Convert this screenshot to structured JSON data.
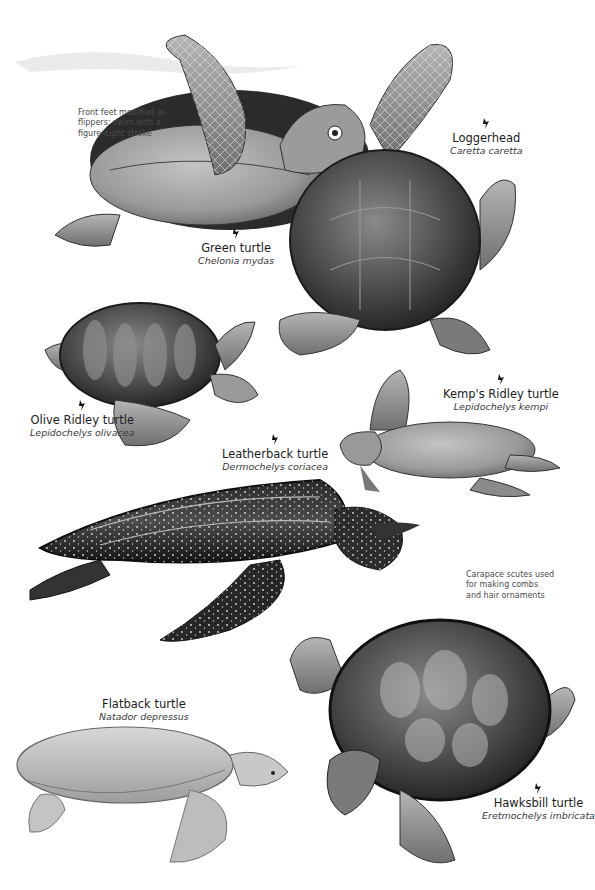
{
  "page": {
    "background": "#ffffff",
    "ink": "#1c1c1c"
  },
  "notes": {
    "green_turtle": "Front feet modified as\nflippers; swim with a\nfigure-eight stroke",
    "hawksbill": "Carapace scutes used\nfor making combs\nand hair ornaments"
  },
  "turtles": [
    {
      "id": "loggerhead",
      "common": "Loggerhead",
      "scientific": "Caretta caretta",
      "icon": "pointer-icon"
    },
    {
      "id": "green",
      "common": "Green turtle",
      "scientific": "Chelonia mydas",
      "icon": "pointer-icon"
    },
    {
      "id": "olive-ridley",
      "common": "Olive Ridley turtle",
      "scientific": "Lepidochelys olivacea",
      "icon": "pointer-icon"
    },
    {
      "id": "kemps-ridley",
      "common": "Kemp's Ridley turtle",
      "scientific": "Lepidochelys kempi",
      "icon": "pointer-icon"
    },
    {
      "id": "leatherback",
      "common": "Leatherback turtle",
      "scientific": "Dermochelys coriacea",
      "icon": "pointer-icon"
    },
    {
      "id": "flatback",
      "common": "Flatback turtle",
      "scientific": "Natador depressus",
      "icon": null
    },
    {
      "id": "hawksbill",
      "common": "Hawksbill turtle",
      "scientific": "Eretmochelys imbricata",
      "icon": "pointer-icon"
    }
  ]
}
